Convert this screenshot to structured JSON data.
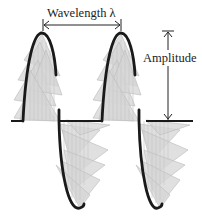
{
  "diagram": {
    "labels": {
      "wavelength": "Wavelength λ",
      "amplitude": "Amplitude"
    },
    "colors": {
      "curve": "#1a1a1a",
      "fill": "#d9d9d9",
      "fill_stroke": "#b0b0b0",
      "arrows": "#222222",
      "background": "#ffffff"
    },
    "elements": [
      {
        "type": "baseline",
        "description": "horizontal axis line"
      },
      {
        "type": "wave-curve",
        "description": "thick black wave curve, two cycles"
      },
      {
        "type": "shading",
        "description": "gray translucent triangles filling the wave"
      },
      {
        "type": "dimension-arrow",
        "label": "Wavelength λ",
        "orientation": "horizontal"
      },
      {
        "type": "dimension-arrow",
        "label": "Amplitude",
        "orientation": "vertical"
      }
    ]
  }
}
